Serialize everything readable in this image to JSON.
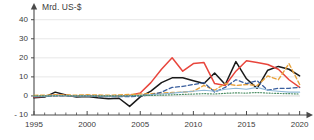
{
  "chart_data": {
    "type": "line",
    "title": "Mrd. US-$",
    "xlabel": "",
    "ylabel": "Mrd. US-$",
    "xlim": [
      1995,
      2020.6
    ],
    "ylim": [
      -10,
      43
    ],
    "yticks": [
      -10,
      0,
      10,
      20,
      30,
      40
    ],
    "ytick_labels": [
      "- 10",
      "0",
      "10",
      "20",
      "30",
      "40"
    ],
    "xticks": [
      1995,
      2000,
      2005,
      2010,
      2015,
      2020
    ],
    "xtick_labels": [
      "1995",
      "2000",
      "2005",
      "2010",
      "2015",
      "2020"
    ],
    "minor_xtick_interval": 1,
    "grid": "horizontal",
    "grid_color": "#dcdcdc",
    "axis_color": "#4a4a4a",
    "legend_position": "none",
    "x": [
      1995,
      1996,
      1997,
      1998,
      1999,
      2000,
      2001,
      2002,
      2003,
      2004,
      2005,
      2006,
      2007,
      2008,
      2009,
      2010,
      2011,
      2012,
      2013,
      2014,
      2015,
      2016,
      2017,
      2018,
      2019,
      2020
    ],
    "series": [
      {
        "name": "series-black",
        "color": "#1a1a1a",
        "style": "solid",
        "width": 1.5,
        "values": [
          -1.0,
          -0.6,
          2.0,
          0.5,
          -0.6,
          -0.3,
          -1.0,
          -1.5,
          -1.2,
          -5.5,
          -0.5,
          2.5,
          7.0,
          9.5,
          9.5,
          8.0,
          6.5,
          12.0,
          6.0,
          18.0,
          9.0,
          4.0,
          13.5,
          15.5,
          14.0,
          10.5
        ]
      },
      {
        "name": "series-red",
        "color": "#e8453c",
        "style": "solid",
        "width": 1.5,
        "values": [
          -0.5,
          -0.2,
          0.4,
          0.2,
          0.0,
          0.2,
          0.0,
          -0.2,
          0.0,
          0.2,
          1.5,
          7.0,
          14.0,
          20.0,
          13.0,
          17.0,
          17.5,
          6.5,
          5.5,
          13.0,
          18.5,
          17.5,
          16.5,
          14.0,
          8.5,
          4.5
        ]
      },
      {
        "name": "series-orange",
        "color": "#e8a33d",
        "style": "dashed",
        "width": 1.4,
        "values": [
          0.3,
          0.4,
          0.6,
          0.5,
          0.4,
          0.6,
          0.5,
          0.4,
          0.5,
          0.8,
          1.0,
          1.2,
          1.5,
          1.8,
          2.0,
          2.5,
          5.5,
          3.0,
          6.5,
          5.5,
          6.0,
          5.5,
          10.5,
          8.5,
          17.0,
          6.0
        ]
      },
      {
        "name": "series-blue",
        "color": "#3a5f9e",
        "style": "dashed",
        "width": 1.3,
        "values": [
          -0.4,
          -0.3,
          0.1,
          0.0,
          -0.2,
          0.0,
          -0.3,
          -0.4,
          -0.3,
          -0.4,
          0.0,
          0.5,
          2.0,
          4.5,
          5.0,
          6.0,
          7.0,
          2.0,
          4.5,
          8.5,
          6.5,
          8.0,
          3.0,
          4.0,
          4.0,
          4.5
        ]
      },
      {
        "name": "series-lightblue",
        "color": "#8fb9d8",
        "style": "solid",
        "width": 1.1,
        "values": [
          -0.2,
          -0.1,
          0.2,
          0.1,
          0.0,
          0.1,
          0.0,
          -0.1,
          0.0,
          0.1,
          0.3,
          0.6,
          1.0,
          1.5,
          2.0,
          2.5,
          3.0,
          2.5,
          3.5,
          4.0,
          3.5,
          4.5,
          3.0,
          2.5,
          2.0,
          2.0
        ]
      },
      {
        "name": "series-green",
        "color": "#4e8f66",
        "style": "dotted",
        "width": 1.2,
        "values": [
          0.0,
          0.0,
          0.1,
          0.1,
          0.0,
          0.1,
          0.0,
          0.0,
          0.0,
          0.1,
          0.2,
          0.3,
          0.4,
          0.6,
          0.8,
          1.0,
          1.2,
          1.0,
          1.4,
          1.6,
          1.5,
          1.8,
          1.5,
          1.3,
          1.2,
          1.0
        ]
      }
    ]
  }
}
